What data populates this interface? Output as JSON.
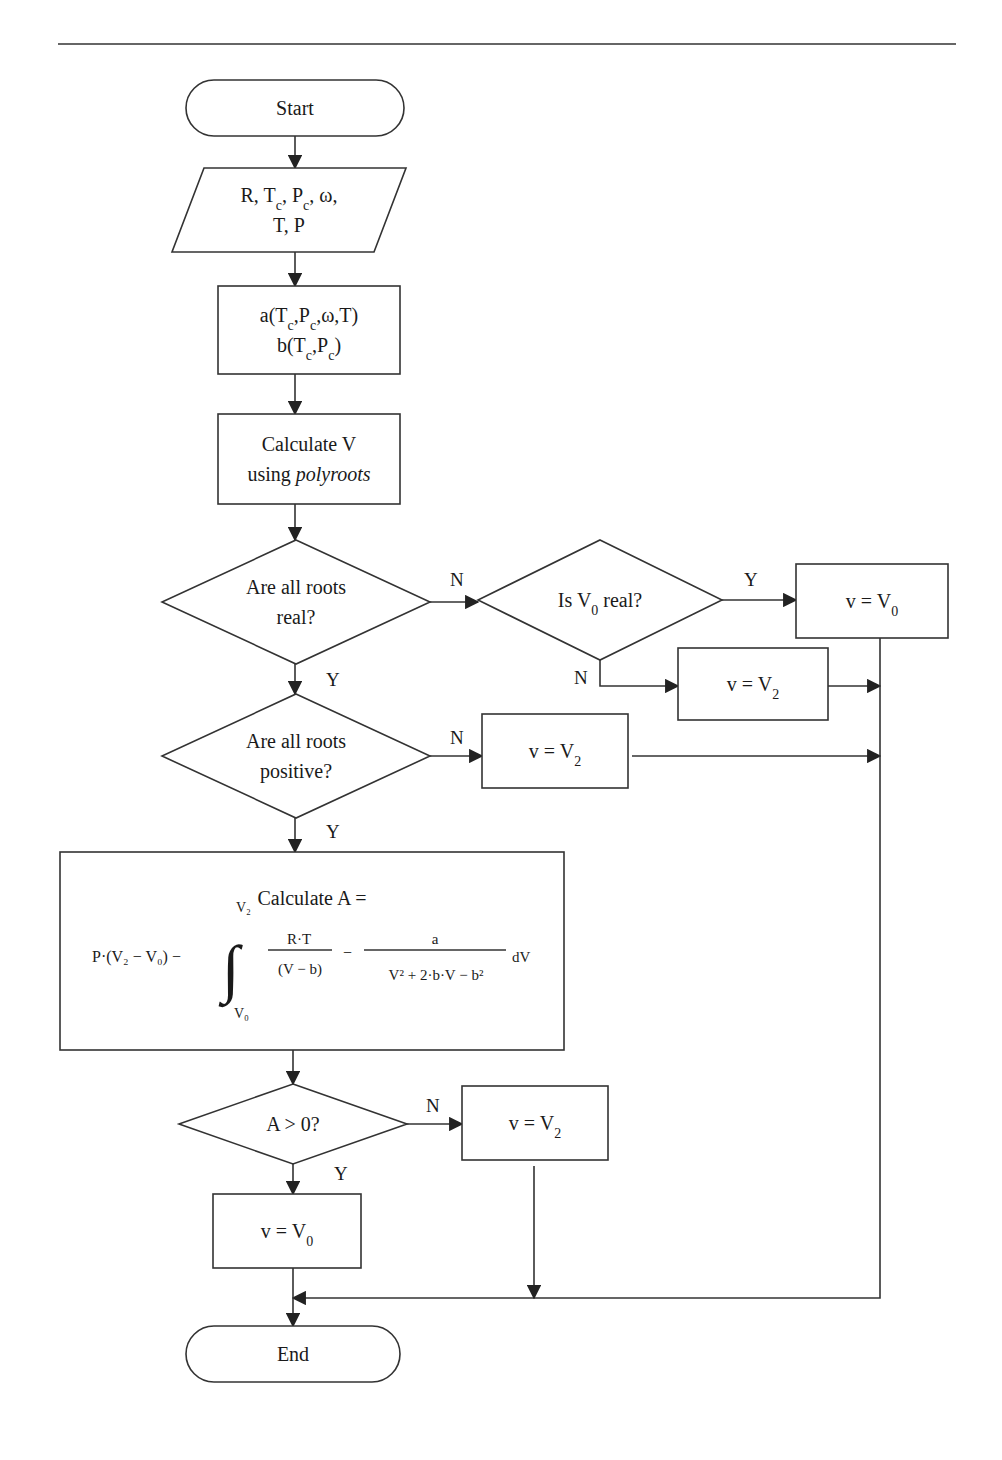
{
  "diagram": {
    "type": "flowchart",
    "top_rule": {
      "y": 44,
      "x1": 58,
      "x2": 956
    },
    "nodes": [
      {
        "id": "start",
        "kind": "terminator",
        "x": 186,
        "y": 80,
        "w": 218,
        "h": 56,
        "lines": [
          [
            {
              "t": "Start"
            }
          ]
        ]
      },
      {
        "id": "input",
        "kind": "io",
        "x": 172,
        "y": 168,
        "w": 234,
        "h": 84,
        "skew": 32,
        "lines": [
          [
            {
              "t": "R, T"
            },
            {
              "t": "c",
              "sub": true
            },
            {
              "t": ", P"
            },
            {
              "t": "c",
              "sub": true
            },
            {
              "t": ", ω,"
            }
          ],
          [
            {
              "t": "T, P"
            }
          ]
        ]
      },
      {
        "id": "params",
        "kind": "process",
        "x": 218,
        "y": 286,
        "w": 182,
        "h": 88,
        "lines": [
          [
            {
              "t": "a(T"
            },
            {
              "t": "c",
              "sub": true
            },
            {
              "t": ",P"
            },
            {
              "t": "c",
              "sub": true
            },
            {
              "t": ",ω,T)"
            }
          ],
          [
            {
              "t": "b(T"
            },
            {
              "t": "c",
              "sub": true
            },
            {
              "t": ",P"
            },
            {
              "t": "c",
              "sub": true
            },
            {
              "t": ")"
            }
          ]
        ]
      },
      {
        "id": "calcV",
        "kind": "process",
        "x": 218,
        "y": 414,
        "w": 182,
        "h": 90,
        "lines": [
          [
            {
              "t": "Calculate V"
            }
          ],
          [
            {
              "t": "using "
            },
            {
              "t": "polyroots",
              "italic": true
            }
          ]
        ]
      },
      {
        "id": "allReal",
        "kind": "decision",
        "cx": 296,
        "cy": 602,
        "hw": 134,
        "hh": 62,
        "lines": [
          [
            {
              "t": "Are all roots"
            }
          ],
          [
            {
              "t": "real?"
            }
          ]
        ]
      },
      {
        "id": "v0Real",
        "kind": "decision",
        "cx": 600,
        "cy": 600,
        "hw": 122,
        "hh": 60,
        "lines": [
          [
            {
              "t": "Is V"
            },
            {
              "t": "0",
              "sub": true
            },
            {
              "t": " real?"
            }
          ]
        ]
      },
      {
        "id": "setV0a",
        "kind": "process",
        "x": 796,
        "y": 564,
        "w": 152,
        "h": 74,
        "lines": [
          [
            {
              "t": "v = V"
            },
            {
              "t": "0",
              "sub": true
            }
          ]
        ]
      },
      {
        "id": "setV2a",
        "kind": "process",
        "x": 678,
        "y": 648,
        "w": 150,
        "h": 72,
        "lines": [
          [
            {
              "t": "v = V"
            },
            {
              "t": "2",
              "sub": true
            }
          ]
        ]
      },
      {
        "id": "allPos",
        "kind": "decision",
        "cx": 296,
        "cy": 756,
        "hw": 134,
        "hh": 62,
        "lines": [
          [
            {
              "t": "Are all roots"
            }
          ],
          [
            {
              "t": "positive?"
            }
          ]
        ]
      },
      {
        "id": "setV2b",
        "kind": "process",
        "x": 482,
        "y": 714,
        "w": 146,
        "h": 74,
        "lines": [
          [
            {
              "t": "v = V"
            },
            {
              "t": "2",
              "sub": true
            }
          ]
        ]
      },
      {
        "id": "calcA",
        "kind": "formula",
        "x": 60,
        "y": 852,
        "w": 504,
        "h": 198,
        "title": "Calculate A ="
      },
      {
        "id": "aPos",
        "kind": "decision",
        "cx": 293,
        "cy": 1124,
        "hw": 114,
        "hh": 40,
        "lines": [
          [
            {
              "t": "A > 0?"
            }
          ]
        ]
      },
      {
        "id": "setV2c",
        "kind": "process",
        "x": 462,
        "y": 1086,
        "w": 146,
        "h": 74,
        "lines": [
          [
            {
              "t": "v = V"
            },
            {
              "t": "2",
              "sub": true
            }
          ]
        ]
      },
      {
        "id": "setV0b",
        "kind": "process",
        "x": 213,
        "y": 1194,
        "w": 148,
        "h": 74,
        "lines": [
          [
            {
              "t": "v = V"
            },
            {
              "t": "0",
              "sub": true
            }
          ]
        ]
      },
      {
        "id": "end",
        "kind": "terminator",
        "x": 186,
        "y": 1326,
        "w": 214,
        "h": 56,
        "lines": [
          [
            {
              "t": "End"
            }
          ]
        ]
      }
    ],
    "edges": [
      {
        "from": "start",
        "to": "input",
        "points": [
          [
            295,
            136
          ],
          [
            295,
            168
          ]
        ],
        "arrow": true
      },
      {
        "from": "input",
        "to": "params",
        "points": [
          [
            295,
            252
          ],
          [
            295,
            286
          ]
        ],
        "arrow": true
      },
      {
        "from": "params",
        "to": "calcV",
        "points": [
          [
            295,
            374
          ],
          [
            295,
            414
          ]
        ],
        "arrow": true
      },
      {
        "from": "calcV",
        "to": "allReal",
        "points": [
          [
            295,
            504
          ],
          [
            295,
            540
          ]
        ],
        "arrow": true
      },
      {
        "from": "allReal",
        "to": "v0Real",
        "label": "N",
        "label_at": [
          450,
          586
        ],
        "points": [
          [
            430,
            602
          ],
          [
            478,
            602
          ]
        ],
        "arrow": true
      },
      {
        "from": "v0Real",
        "to": "setV0a",
        "label": "Y",
        "label_at": [
          744,
          586
        ],
        "points": [
          [
            722,
            600
          ],
          [
            796,
            600
          ]
        ],
        "arrow": true
      },
      {
        "from": "v0Real",
        "to": "setV2a",
        "label": "N",
        "label_at": [
          574,
          684
        ],
        "points": [
          [
            600,
            660
          ],
          [
            600,
            686
          ],
          [
            678,
            686
          ]
        ],
        "arrow": true
      },
      {
        "from": "allReal",
        "to": "allPos",
        "label": "Y",
        "label_at": [
          326,
          686
        ],
        "points": [
          [
            295,
            664
          ],
          [
            295,
            694
          ]
        ],
        "arrow": true
      },
      {
        "from": "allPos",
        "to": "setV2b",
        "label": "N",
        "label_at": [
          450,
          744
        ],
        "points": [
          [
            430,
            756
          ],
          [
            482,
            756
          ]
        ],
        "arrow": true
      },
      {
        "from": "allPos",
        "to": "calcA",
        "label": "Y",
        "label_at": [
          326,
          838
        ],
        "points": [
          [
            295,
            818
          ],
          [
            295,
            852
          ]
        ],
        "arrow": true
      },
      {
        "from": "calcA",
        "to": "aPos",
        "points": [
          [
            293,
            1050
          ],
          [
            293,
            1084
          ]
        ],
        "arrow": true
      },
      {
        "from": "aPos",
        "to": "setV2c",
        "label": "N",
        "label_at": [
          426,
          1112
        ],
        "points": [
          [
            407,
            1124
          ],
          [
            462,
            1124
          ]
        ],
        "arrow": true
      },
      {
        "from": "aPos",
        "to": "setV0b",
        "label": "Y",
        "label_at": [
          334,
          1180
        ],
        "points": [
          [
            293,
            1164
          ],
          [
            293,
            1194
          ]
        ],
        "arrow": true
      },
      {
        "from": "setV2a",
        "to": "collector",
        "points": [
          [
            828,
            686
          ],
          [
            880,
            686
          ]
        ],
        "arrow": true
      },
      {
        "from": "setV2b",
        "to": "collector",
        "points": [
          [
            632,
            756
          ],
          [
            880,
            756
          ]
        ],
        "arrow": true
      },
      {
        "from": "setV0a",
        "to": "collector",
        "points": [
          [
            880,
            638
          ],
          [
            880,
            1298
          ],
          [
            293,
            1298
          ]
        ],
        "arrow": true
      },
      {
        "from": "setV2c",
        "to": "merge",
        "points": [
          [
            534,
            1166
          ],
          [
            534,
            1298
          ]
        ],
        "arrow": true
      },
      {
        "from": "setV0b",
        "to": "end",
        "points": [
          [
            293,
            1268
          ],
          [
            293,
            1326
          ]
        ],
        "arrow": true
      }
    ],
    "formula": {
      "prefix": "P·(V₂ − V₀) −",
      "integral_upper": "V₂",
      "integral_lower": "V₀",
      "frac1_num": "R·T",
      "frac1_den": "(V − b)",
      "minus": "−",
      "frac2_num": "a",
      "frac2_den": "V² + 2·b·V − b²",
      "suffix": "dV"
    }
  }
}
